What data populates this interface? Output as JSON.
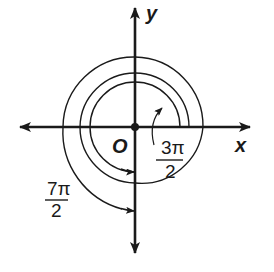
{
  "diagram": {
    "axes": {
      "x_label": "x",
      "y_label": "y",
      "origin_label": "O"
    },
    "angles": [
      {
        "name": "three-pi-over-two",
        "numerator": "3π",
        "denominator": "2",
        "radians": "3π/2",
        "direction": "counterclockwise",
        "terminal_side": "negative y-axis"
      },
      {
        "name": "seven-pi-over-two",
        "numerator": "7π",
        "denominator": "2",
        "radians": "7π/2",
        "direction": "counterclockwise",
        "terminal_side": "negative y-axis"
      }
    ],
    "colors": {
      "ink": "#1a1a1a",
      "background": "#ffffff"
    }
  }
}
